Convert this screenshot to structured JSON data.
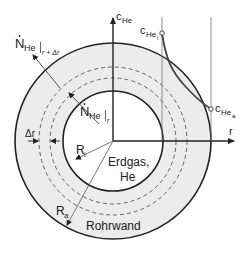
{
  "diagram": {
    "colors": {
      "wall_fill": "#ececec",
      "line": "#222222",
      "thin_line": "#666666",
      "curve": "#444444"
    },
    "labels": {
      "flux_outer": {
        "main": "N",
        "sub": "He",
        "eval": "r + Δr"
      },
      "flux_inner": {
        "main": "N",
        "sub": "He",
        "eval": "r"
      },
      "axis_c": {
        "main": "c",
        "sub": "He"
      },
      "axis_r": "r",
      "c_inner": {
        "main": "c",
        "sub": "He",
        "subsub": "i"
      },
      "c_outer": {
        "main": "c",
        "sub": "He",
        "subsub": "a"
      },
      "delta_r": "Δr",
      "radius_inner": {
        "main": "R",
        "sub": "i"
      },
      "radius_outer": {
        "main": "R",
        "sub": "a"
      },
      "gas_line1": "Erdgas,",
      "gas_line2": "He",
      "wall": "Rohrwand"
    }
  }
}
